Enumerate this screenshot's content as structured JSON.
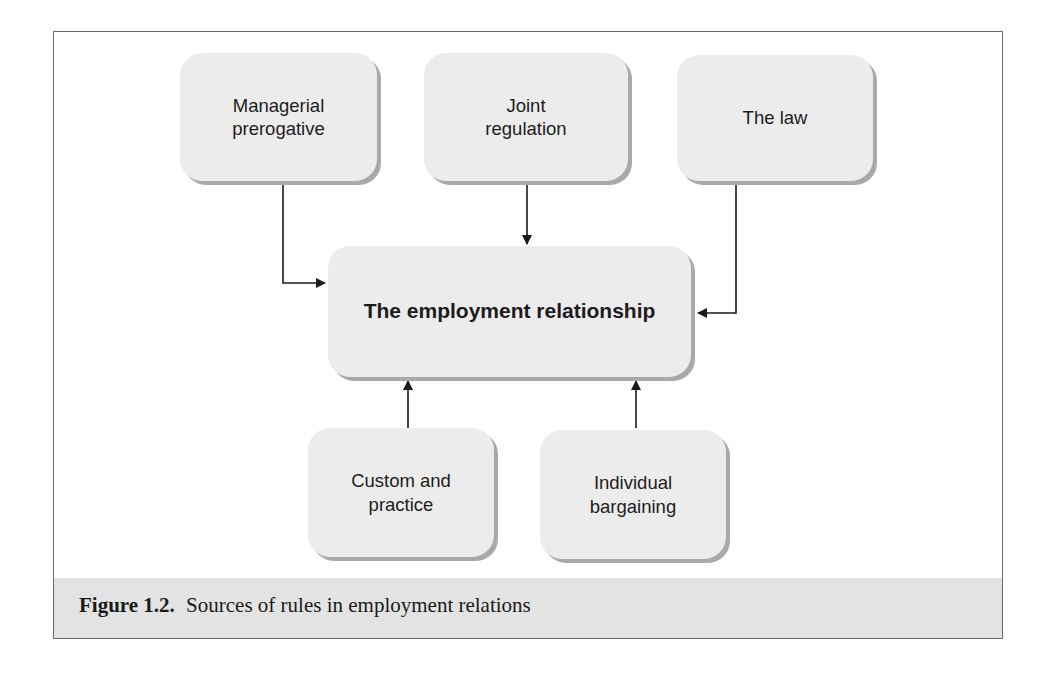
{
  "figure": {
    "label": "Figure 1.2.",
    "title": "Sources of rules in employment relations"
  },
  "nodes": {
    "center": {
      "label": "The employment relationship"
    },
    "managerial": {
      "line1": "Managerial",
      "line2": "prerogative"
    },
    "joint": {
      "line1": "Joint",
      "line2": "regulation"
    },
    "law": {
      "line1": "The law"
    },
    "custom": {
      "line1": "Custom and",
      "line2": "practice"
    },
    "individual": {
      "line1": "Individual",
      "line2": "bargaining"
    }
  },
  "edges": [
    {
      "from": "Managerial prerogative",
      "to": "The employment relationship"
    },
    {
      "from": "Joint regulation",
      "to": "The employment relationship"
    },
    {
      "from": "The law",
      "to": "The employment relationship"
    },
    {
      "from": "Custom and practice",
      "to": "The employment relationship"
    },
    {
      "from": "Individual bargaining",
      "to": "The employment relationship"
    }
  ],
  "colors": {
    "node_fill": "#ececec",
    "node_shadow": "#a9a9a9",
    "caption_band": "#e3e3e3",
    "line": "#1a1a1a"
  }
}
